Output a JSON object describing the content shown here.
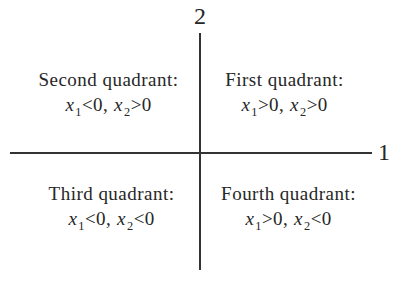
{
  "figure": {
    "type": "quadrant-diagram",
    "background_color": "#ffffff",
    "line_color": "#333333",
    "text_color": "#262626",
    "axis_labels": {
      "vertical": "2",
      "horizontal": "1"
    },
    "quadrants": [
      {
        "position": "top-left",
        "title": "Second quadrant:",
        "var1": "x",
        "sub1": "1",
        "rel1": "<0,",
        "var2": "x",
        "sub2": "2",
        "rel2": ">0"
      },
      {
        "position": "top-right",
        "title": "First quadrant:",
        "var1": "x",
        "sub1": "1",
        "rel1": ">0,",
        "var2": "x",
        "sub2": "2",
        "rel2": ">0"
      },
      {
        "position": "bottom-left",
        "title": "Third quadrant:",
        "var1": "x",
        "sub1": "1",
        "rel1": "<0,",
        "var2": "x",
        "sub2": "2",
        "rel2": "<0"
      },
      {
        "position": "bottom-right",
        "title": "Fourth quadrant:",
        "var1": "x",
        "sub1": "1",
        "rel1": ">0,",
        "var2": "x",
        "sub2": "2",
        "rel2": "<0"
      }
    ]
  }
}
